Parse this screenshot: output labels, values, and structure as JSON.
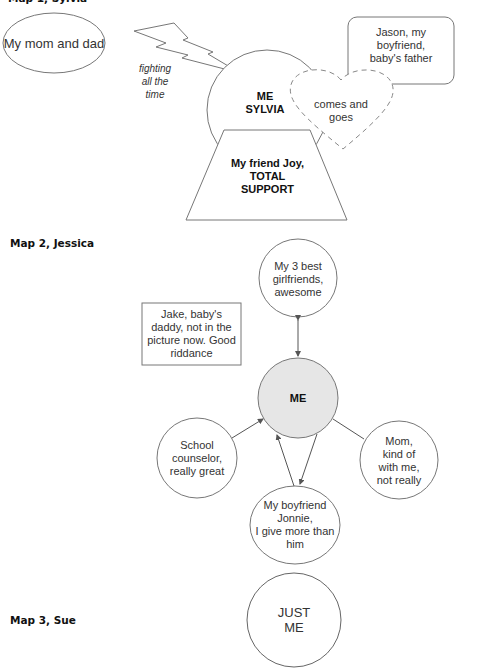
{
  "map1": {
    "title": "Map 1, Sylvia",
    "parents": "My mom and dad",
    "conflict_label": "fighting\nall the\ntime",
    "center": "ME\nSYLVIA",
    "friend": "My friend Joy,\nTOTAL\nSUPPORT",
    "heart": "comes and\ngoes",
    "boyfriend": "Jason, my\nboyfriend,\nbaby's father"
  },
  "map2": {
    "title": "Map 2, Jessica",
    "girlfriends": "My 3 best\ngirlfriends,\nawesome",
    "ex": "Jake, baby's\ndaddy, not in the\npicture now. Good\nriddance",
    "center": "ME",
    "counselor": "School\ncounselor,\nreally great",
    "mom": "Mom,\nkind of\nwith me,\nnot really",
    "boyfriend": "My boyfriend\nJonnie,\nI give more than\nhim"
  },
  "map3": {
    "title": "Map 3, Sue",
    "center": "JUST\nME"
  },
  "colors": {
    "stroke": "#6f6f6f",
    "me_fill": "#e6e6e6"
  }
}
